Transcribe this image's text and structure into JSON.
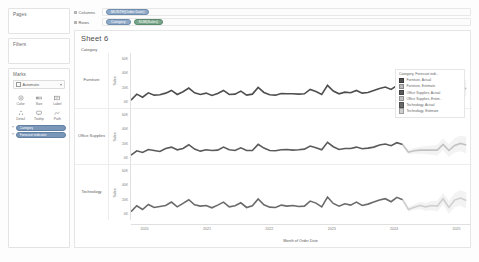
{
  "sidebar": {
    "pages": {
      "title": "Pages"
    },
    "filters": {
      "title": "Filters"
    },
    "marks": {
      "title": "Marks",
      "mark_type": "Automatic",
      "buttons": [
        {
          "name": "color",
          "label": "Color",
          "icon": "color-icon"
        },
        {
          "name": "size",
          "label": "Size",
          "icon": "size-icon"
        },
        {
          "name": "label",
          "label": "Label",
          "icon": "label-icon"
        },
        {
          "name": "detail",
          "label": "Detail",
          "icon": "detail-icon"
        },
        {
          "name": "tooltip",
          "label": "Tooltip",
          "icon": "tooltip-icon"
        },
        {
          "name": "path",
          "label": "Path",
          "icon": "path-icon"
        }
      ],
      "pills": [
        {
          "label": "Category",
          "color": "#7a96b8"
        },
        {
          "label": "Forecast indicator",
          "color": "#7a96b8"
        }
      ]
    }
  },
  "shelves": {
    "columns": {
      "label": "Columns",
      "pills": [
        {
          "label": "MONTH(Order Date)",
          "color": "#8fa9c6"
        }
      ]
    },
    "rows": {
      "label": "Rows",
      "pills": [
        {
          "label": "Category",
          "color": "#8fa9c6"
        },
        {
          "label": "SUM(Sales)",
          "color": "#79a58a"
        }
      ]
    }
  },
  "view": {
    "sheet_title": "Sheet 6",
    "panel_header": "Category",
    "x_axis_title": "Month of Order Date",
    "y_axis_title": "Sales",
    "x_ticks": [
      "2020",
      "2021",
      "2022",
      "2023",
      "2024",
      "2025"
    ],
    "y_ticks": [
      "60K",
      "40K",
      "20K",
      "0K"
    ]
  },
  "legend": {
    "title": "Category, Forecast indi..",
    "items": [
      {
        "label": "Furniture, Actual",
        "color": "#4e4e4e"
      },
      {
        "label": "Furniture, Estimate",
        "color": "#b9b9b9"
      },
      {
        "label": "Office Supplies, Actual",
        "color": "#5a5a5a"
      },
      {
        "label": "Office Supplies, Estim..",
        "color": "#c2c2c2"
      },
      {
        "label": "Technology, Actual",
        "color": "#6a6a6a"
      },
      {
        "label": "Technology, Estimate",
        "color": "#cfcfcf"
      }
    ]
  },
  "chart_data": {
    "type": "line",
    "title": "Sheet 6",
    "xlabel": "Month of Order Date",
    "ylabel": "Sales",
    "ylim": [
      0,
      70000
    ],
    "xlim": [
      "2020-01",
      "2025-06"
    ],
    "grid": false,
    "legend_position": "right",
    "panels": [
      {
        "name": "Furniture",
        "series": [
          {
            "name": "Furniture, Actual",
            "color": "#4e4e4e",
            "values": [
              5200,
              14000,
              9500,
              16000,
              12500,
              13000,
              15500,
              19500,
              13500,
              17500,
              23000,
              16000,
              13500,
              15500,
              12000,
              15000,
              19500,
              13500,
              14000,
              18500,
              12500,
              14000,
              24000,
              16500,
              13000,
              12500,
              15000,
              14500,
              14500,
              14000,
              14500,
              21000,
              18000,
              13500,
              27000,
              18500,
              14500,
              17000,
              16000,
              19500,
              15500,
              16500,
              19500,
              22500,
              24500,
              21000,
              26500,
              23000
            ]
          },
          {
            "name": "Furniture, Estimate",
            "color": "#b9b9b9",
            "values": [
              23000,
              9500,
              12000,
              14500,
              13500,
              14500,
              14500,
              24500,
              12500,
              22500,
              25500,
              22000
            ]
          }
        ]
      },
      {
        "name": "Office Supplies",
        "series": [
          {
            "name": "Office Supplies, Actual",
            "color": "#5a5a5a",
            "values": [
              6500,
              13000,
              10500,
              15000,
              13500,
              12000,
              16500,
              18500,
              14500,
              16500,
              22000,
              15500,
              12500,
              14500,
              13500,
              14000,
              18500,
              14500,
              13500,
              17500,
              13500,
              13500,
              22500,
              17000,
              13500,
              13000,
              14500,
              15000,
              14000,
              14500,
              15500,
              20000,
              17500,
              14500,
              25500,
              19000,
              15000,
              16500,
              16500,
              18500,
              16000,
              17000,
              18500,
              21500,
              23000,
              20500,
              25000,
              22500
            ]
          },
          {
            "name": "Office Supplies, Estimate",
            "color": "#c2c2c2",
            "values": [
              22000,
              11000,
              13000,
              14000,
              14000,
              14000,
              14000,
              22500,
              13500,
              21000,
              24000,
              21500
            ]
          }
        ]
      },
      {
        "name": "Technology",
        "series": [
          {
            "name": "Technology, Actual",
            "color": "#6a6a6a",
            "values": [
              5800,
              14500,
              9000,
              16500,
              12000,
              13500,
              15000,
              20000,
              13000,
              18000,
              23500,
              16000,
              14000,
              15000,
              11500,
              15500,
              20000,
              13000,
              14500,
              19000,
              12000,
              14500,
              24500,
              16000,
              12500,
              12000,
              15500,
              14000,
              15000,
              13500,
              14000,
              21500,
              18500,
              13000,
              27500,
              18000,
              14000,
              17500,
              15500,
              20000,
              15000,
              17000,
              20000,
              23000,
              25000,
              20500,
              27000,
              23500
            ]
          },
          {
            "name": "Technology, Estimate",
            "color": "#cfcfcf",
            "values": [
              23500,
              9000,
              12500,
              15000,
              13000,
              15000,
              14000,
              25000,
              12000,
              23000,
              26000,
              22500
            ]
          }
        ]
      }
    ]
  }
}
